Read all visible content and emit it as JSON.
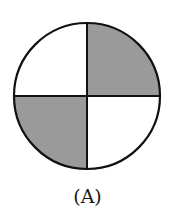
{
  "figure": {
    "label": "(A)",
    "shape": "circle divided into four quadrants",
    "colors": {
      "outline": "#111111",
      "shaded": "#9a9a9a",
      "unshaded": "#ffffff"
    },
    "quadrants": [
      {
        "position": "top-left",
        "shaded": false
      },
      {
        "position": "top-right",
        "shaded": true
      },
      {
        "position": "bottom-left",
        "shaded": true
      },
      {
        "position": "bottom-right",
        "shaded": false
      }
    ]
  }
}
